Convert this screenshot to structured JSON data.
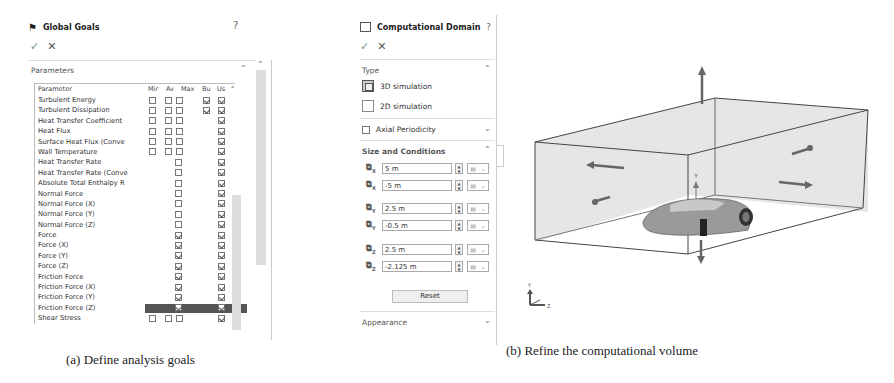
{
  "left_panel": {
    "title": "Global Goals",
    "help_icon": "?",
    "ok_icon": "✓",
    "cancel_icon": "✕",
    "section": "Parameters",
    "columns": [
      "Parameter",
      "Mir",
      "Av",
      "Max",
      "Bu",
      "Us"
    ],
    "rows": [
      {
        "name": "Turbulent Energy",
        "min": false,
        "av": false,
        "max": false,
        "bulk": true,
        "use": true,
        "layout": "full"
      },
      {
        "name": "Turbulent Dissipation",
        "min": false,
        "av": false,
        "max": false,
        "bulk": true,
        "use": true,
        "layout": "full"
      },
      {
        "name": "Heat Transfer Coefficient",
        "min": false,
        "av": false,
        "max": false,
        "bulk": null,
        "use": true,
        "layout": "full"
      },
      {
        "name": "Heat Flux",
        "min": false,
        "av": false,
        "max": false,
        "bulk": null,
        "use": true,
        "layout": "full"
      },
      {
        "name": "Surface Heat Flux (Conve",
        "min": false,
        "av": false,
        "max": false,
        "bulk": null,
        "use": true,
        "layout": "full"
      },
      {
        "name": "Wall Temperature",
        "min": false,
        "av": false,
        "max": false,
        "bulk": null,
        "use": true,
        "layout": "full"
      },
      {
        "name": "Heat Transfer Rate",
        "single": false,
        "use": true,
        "layout": "single"
      },
      {
        "name": "Heat Transfer Rate (Conve",
        "single": false,
        "use": true,
        "layout": "single"
      },
      {
        "name": "Absolute Total Enthalpy R",
        "single": false,
        "use": true,
        "layout": "single"
      },
      {
        "name": "Normal Force",
        "single": false,
        "use": true,
        "layout": "single"
      },
      {
        "name": "Normal Force (X)",
        "single": false,
        "use": true,
        "layout": "single"
      },
      {
        "name": "Normal Force (Y)",
        "single": false,
        "use": true,
        "layout": "single"
      },
      {
        "name": "Normal Force (Z)",
        "single": false,
        "use": true,
        "layout": "single"
      },
      {
        "name": "Force",
        "single": true,
        "use": true,
        "layout": "single"
      },
      {
        "name": "Force (X)",
        "single": true,
        "use": true,
        "layout": "single"
      },
      {
        "name": "Force (Y)",
        "single": true,
        "use": true,
        "layout": "single"
      },
      {
        "name": "Force (Z)",
        "single": true,
        "use": true,
        "layout": "single"
      },
      {
        "name": "Friction Force",
        "single": true,
        "use": true,
        "layout": "single"
      },
      {
        "name": "Friction Force (X)",
        "single": true,
        "use": true,
        "layout": "single"
      },
      {
        "name": "Friction Force (Y)",
        "single": true,
        "use": true,
        "layout": "single"
      },
      {
        "name": "Friction Force (Z)",
        "single": true,
        "use": true,
        "layout": "single",
        "selected": true
      },
      {
        "name": "Shear Stress",
        "min": false,
        "av": false,
        "max": false,
        "bulk": null,
        "use": true,
        "layout": "full"
      }
    ],
    "caption": "(a) Define analysis goals"
  },
  "mid_panel": {
    "title": "Computational Domain",
    "help_icon": "?",
    "ok_icon": "✓",
    "cancel_icon": "✕",
    "type_section": "Type",
    "type_options": [
      {
        "label": "3D simulation",
        "selected": true
      },
      {
        "label": "2D simulation",
        "selected": false
      }
    ],
    "axial_periodicity": {
      "label": "Axial Periodicity",
      "checked": false
    },
    "size_section": "Size and Conditions",
    "fields": [
      {
        "axis": "X",
        "value": "5 m"
      },
      {
        "axis": "X",
        "value": "-5 m"
      },
      {
        "axis": "Y",
        "value": "2.5 m"
      },
      {
        "axis": "Y",
        "value": "-0.5 m"
      },
      {
        "axis": "Z",
        "value": "2.5 m"
      },
      {
        "axis": "Z",
        "value": "-2.125 m"
      }
    ],
    "reset_label": "Reset",
    "appearance_section": "Appearance",
    "caption": "(b) Refine the computational volume"
  },
  "viewport": {
    "axis_label_y": "Y",
    "triad_labels": {
      "y": "Y",
      "x": "X",
      "z": "Z"
    },
    "box_fill": "#e6e6e6",
    "edge_color": "#444444"
  }
}
